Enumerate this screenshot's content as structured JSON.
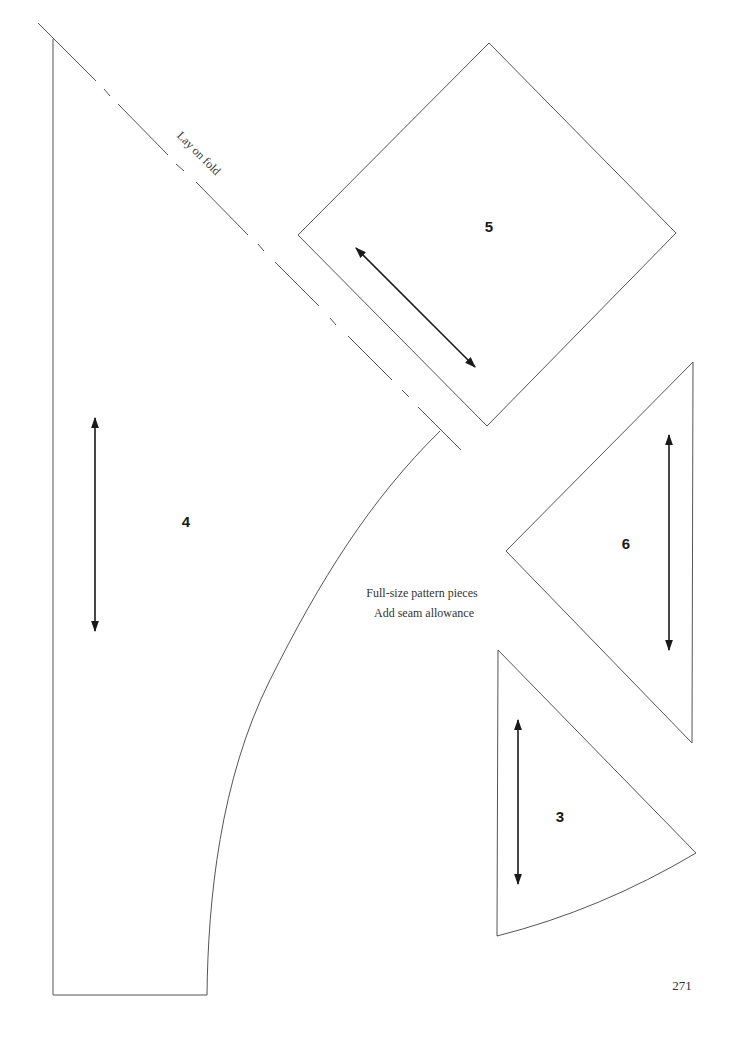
{
  "page": {
    "number": "271"
  },
  "caption": {
    "line1": "Full-size pattern pieces",
    "line2": "Add seam allowance"
  },
  "fold_line": {
    "label": "Lay on fold"
  },
  "pieces": [
    {
      "id": "4",
      "label": "4",
      "shape": "quarter-circle skirt panel with fold edge and curved side",
      "grainline": "vertical"
    },
    {
      "id": "5",
      "label": "5",
      "shape": "square rotated 45 degrees",
      "grainline": "diagonal"
    },
    {
      "id": "6",
      "label": "6",
      "shape": "right isosceles triangle",
      "grainline": "vertical"
    },
    {
      "id": "3",
      "label": "3",
      "shape": "wedge with curved bottom edge",
      "grainline": "vertical"
    }
  ],
  "colors": {
    "outline": "#555555",
    "grainline": "#1a1a1a",
    "text": "#333333",
    "background": "#ffffff"
  }
}
